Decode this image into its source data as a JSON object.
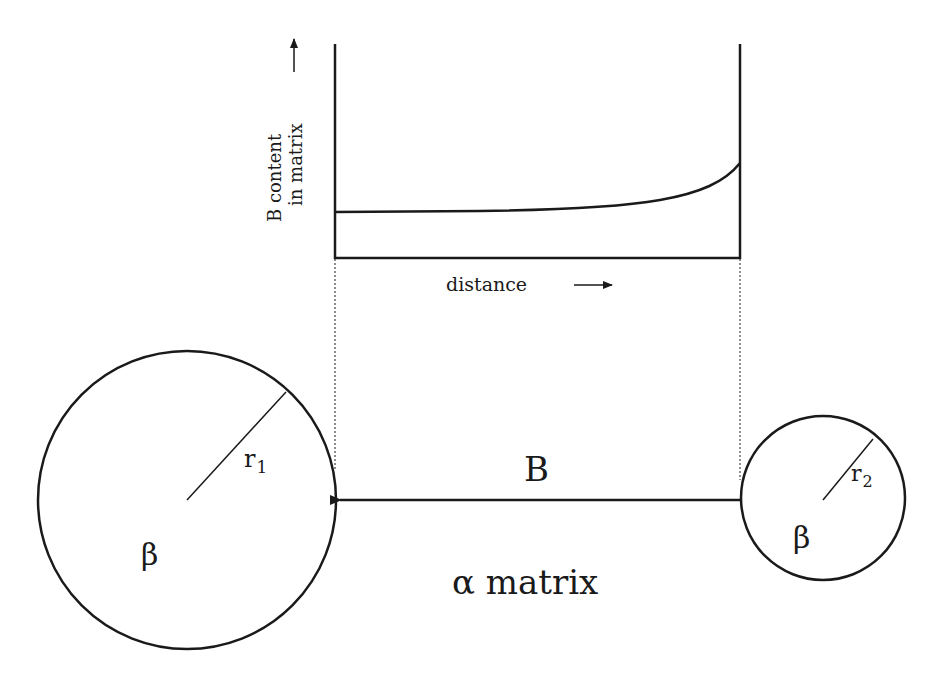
{
  "diagram": {
    "title": "",
    "plot": {
      "ylabel_line1": "B content",
      "ylabel_line2": "in matrix",
      "ylabel_arrow": "→",
      "xlabel": "distance",
      "xlabel_arrow": "→",
      "curve_description": "flat B concentration rising sharply near the small particle interface"
    },
    "particles": [
      {
        "id": "large",
        "phase_label": "β",
        "radius_label": "r",
        "radius_subscript": "1"
      },
      {
        "id": "small",
        "phase_label": "β",
        "radius_label": "r",
        "radius_subscript": "2"
      }
    ],
    "flux_label": "B",
    "matrix_label": "α matrix",
    "colors": {
      "line": "#1a1a1a",
      "background": "#ffffff"
    }
  }
}
